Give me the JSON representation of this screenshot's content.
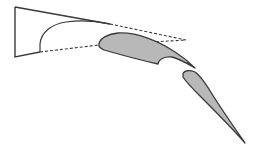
{
  "diagram": {
    "type": "airfoil-high-lift-flap-system",
    "colors": {
      "background": "#ffffff",
      "outline": "#3a3a3a",
      "flap_fill": "#b8b8b8",
      "main_fill": "#ffffff"
    },
    "elements": [
      {
        "name": "main-wing-section",
        "filled": false
      },
      {
        "name": "fore-flap",
        "filled": true
      },
      {
        "name": "aft-flap",
        "filled": true
      }
    ],
    "stowed_outline": {
      "style": "dashed"
    }
  }
}
